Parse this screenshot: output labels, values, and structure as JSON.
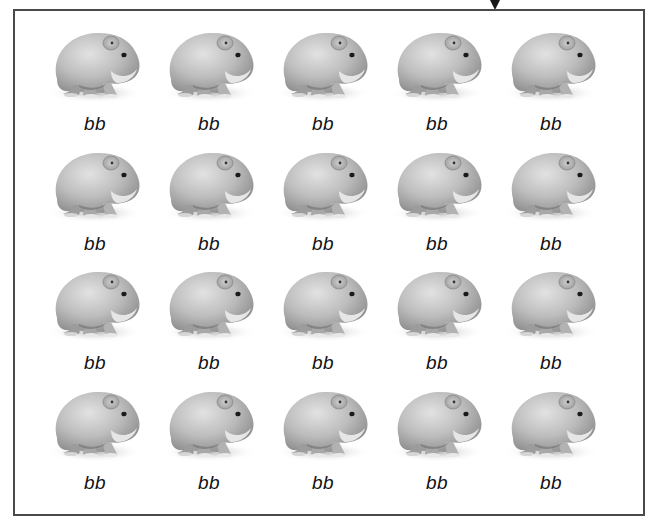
{
  "figure": {
    "arrow_marker": "down-arrow",
    "rows": 4,
    "columns": 5,
    "colors": {
      "border": "#4a4a4a",
      "fur_light": "#d8d8d8",
      "fur_mid": "#b4b4b4",
      "fur_dark": "#8a8a8a",
      "label_text": "#111111"
    },
    "grid": [
      [
        {
          "genotype": "bb"
        },
        {
          "genotype": "bb"
        },
        {
          "genotype": "bb"
        },
        {
          "genotype": "bb"
        },
        {
          "genotype": "bb"
        }
      ],
      [
        {
          "genotype": "bb"
        },
        {
          "genotype": "bb"
        },
        {
          "genotype": "bb"
        },
        {
          "genotype": "bb"
        },
        {
          "genotype": "bb"
        }
      ],
      [
        {
          "genotype": "bb"
        },
        {
          "genotype": "bb"
        },
        {
          "genotype": "bb"
        },
        {
          "genotype": "bb"
        },
        {
          "genotype": "bb"
        }
      ],
      [
        {
          "genotype": "bb"
        },
        {
          "genotype": "bb"
        },
        {
          "genotype": "bb"
        },
        {
          "genotype": "bb"
        },
        {
          "genotype": "bb"
        }
      ]
    ]
  }
}
